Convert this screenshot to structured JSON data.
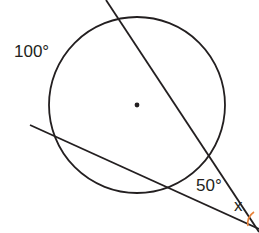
{
  "diagram": {
    "type": "circle-secants",
    "labels": {
      "arc_far": "100°",
      "arc_near": "50°",
      "angle_unknown": "x"
    },
    "colors": {
      "stroke": "#231f20",
      "angle_arc": "#e8833a",
      "background": "#ffffff"
    }
  }
}
